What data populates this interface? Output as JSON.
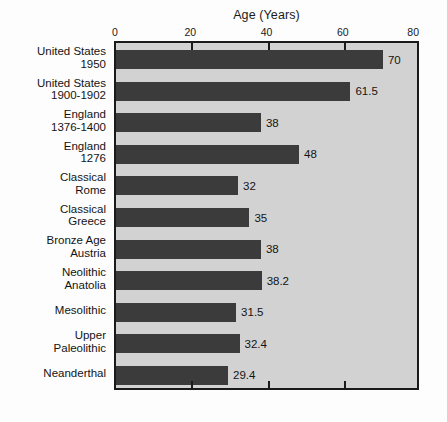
{
  "chart_data": {
    "type": "bar",
    "orientation": "horizontal",
    "title": "Age (Years)",
    "xlabel": "Age (Years)",
    "ylabel": "",
    "xlim": [
      0,
      80
    ],
    "xticks": [
      0,
      20,
      40,
      60,
      80
    ],
    "xtick_labels": [
      "0",
      "20",
      "40",
      "60",
      "80"
    ],
    "grid": false,
    "legend": null,
    "axis_position": "top",
    "categories": [
      "United States\n1950",
      "United States\n1900-1902",
      "England\n1376-1400",
      "England\n1276",
      "Classical\nRome",
      "Classical\nGreece",
      "Bronze Age\nAustria",
      "Neolithic\nAnatolia",
      "Mesolithic",
      "Upper\nPaleolithic",
      "Neanderthal"
    ],
    "values": [
      70,
      61.5,
      38,
      48,
      32,
      35,
      38,
      38.2,
      31.5,
      32.4,
      29.4
    ],
    "value_labels": [
      "70",
      "61.5",
      "38",
      "48",
      "32",
      "35",
      "38",
      "38.2",
      "31.5",
      "32.4",
      "29.4"
    ],
    "colors": {
      "bar": "#3b3b3b",
      "plot_background": "#d2d2d2",
      "figure_background": "#fdfdfd",
      "axis": "#1a1a1a",
      "text": "#141414"
    }
  }
}
